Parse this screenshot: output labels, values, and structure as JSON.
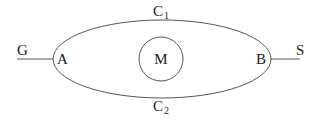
{
  "diagram": {
    "nodes": {
      "G": "G",
      "A": "A",
      "B": "B",
      "S": "S",
      "M": "M"
    },
    "arcs": {
      "upper": {
        "label": "C",
        "subscript": "1"
      },
      "lower": {
        "label": "C",
        "subscript": "2"
      }
    },
    "edges": [
      {
        "from": "G",
        "to": "A"
      },
      {
        "from": "A",
        "to": "B",
        "via": "C1"
      },
      {
        "from": "A",
        "to": "B",
        "via": "C2"
      },
      {
        "from": "B",
        "to": "S"
      }
    ],
    "colors": {
      "stroke": "#555555",
      "text": "#1a1a1a",
      "background": "#ffffff"
    }
  }
}
